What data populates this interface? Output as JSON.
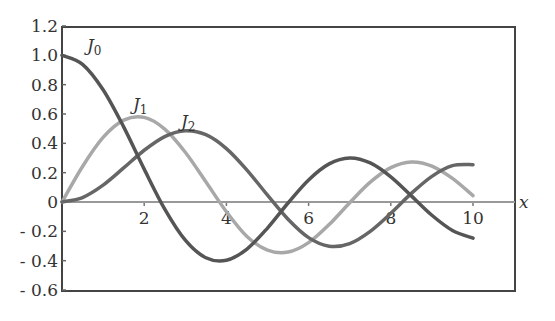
{
  "chart_data": {
    "type": "line",
    "title": "",
    "xlabel": "x",
    "ylabel": "",
    "xlim": [
      0,
      11
    ],
    "ylim": [
      -0.6,
      1.2
    ],
    "grid": false,
    "legend": "inline labels",
    "x_ticks": [
      2,
      4,
      6,
      8,
      10
    ],
    "x_tick_labels": [
      "2",
      "4",
      "6",
      "8",
      "10"
    ],
    "y_ticks": [
      1.2,
      1.0,
      0.8,
      0.6,
      0.4,
      0.2,
      0,
      -0.2,
      -0.4,
      -0.6
    ],
    "y_tick_labels": [
      "1.2",
      "1.0",
      "0.8",
      "0.6",
      "0.4",
      "0.2",
      "0",
      "- 0.2",
      "- 0.4",
      "- 0.6"
    ],
    "x": [
      0,
      0.5,
      1,
      1.5,
      2,
      2.5,
      3,
      3.5,
      4,
      4.5,
      5,
      5.5,
      6,
      6.5,
      7,
      7.5,
      8,
      8.5,
      9,
      9.5,
      10
    ],
    "series": [
      {
        "name": "J0",
        "label_main": "J",
        "label_sub": "0",
        "color": "#555555",
        "values": [
          1,
          0.9385,
          0.7652,
          0.5118,
          0.2239,
          -0.0484,
          -0.2601,
          -0.3801,
          -0.3971,
          -0.3205,
          -0.1776,
          -0.0068,
          0.1506,
          0.2601,
          0.3001,
          0.2663,
          0.1717,
          0.0419,
          -0.0903,
          -0.1939,
          -0.2459
        ]
      },
      {
        "name": "J1",
        "label_main": "J",
        "label_sub": "1",
        "color": "#a8a8a8",
        "values": [
          0,
          0.2423,
          0.4401,
          0.5579,
          0.5767,
          0.4971,
          0.3391,
          0.1374,
          -0.066,
          -0.2346,
          -0.3276,
          -0.3414,
          -0.2767,
          -0.1538,
          -0.0047,
          0.1352,
          0.2346,
          0.2731,
          0.2453,
          0.1613,
          0.0435
        ]
      },
      {
        "name": "J2",
        "label_main": "J",
        "label_sub": "2",
        "color": "#666666",
        "values": [
          0,
          0.0306,
          0.1149,
          0.2321,
          0.3528,
          0.4461,
          0.4861,
          0.4586,
          0.3641,
          0.2178,
          0.0466,
          -0.1173,
          -0.2429,
          -0.3014,
          -0.2834,
          -0.1999,
          -0.0772,
          0.0586,
          0.1749,
          0.2476,
          0.2546
        ]
      }
    ]
  }
}
